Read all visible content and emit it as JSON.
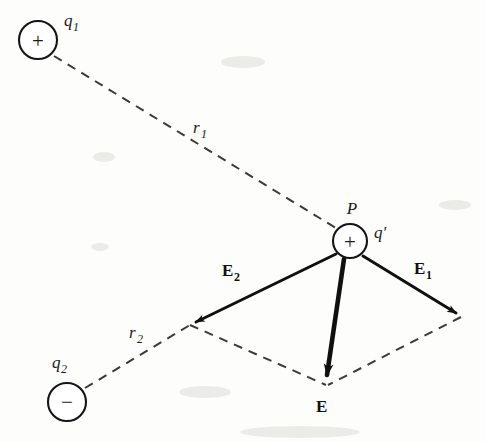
{
  "figure": {
    "background_color": "#fdfdfc",
    "ink_color": "#101010",
    "dash_color": "#3a3a3a",
    "width": 485,
    "height": 442
  },
  "charges": [
    {
      "id": "q1",
      "label": "q",
      "subscript": "1",
      "sign": "+",
      "sign_name": "plus",
      "cx": 38,
      "cy": 40,
      "r": 19,
      "label_x": 64,
      "label_y": 26
    },
    {
      "id": "q2",
      "label": "q",
      "subscript": "2",
      "sign": "−",
      "sign_name": "minus",
      "cx": 67,
      "cy": 402,
      "r": 19,
      "label_x": 52,
      "label_y": 368
    },
    {
      "id": "qprime",
      "label": "q′",
      "subscript": "",
      "sign": "+",
      "sign_name": "plus",
      "cx": 350,
      "cy": 241,
      "r": 17,
      "label_x": 374,
      "label_y": 238
    }
  ],
  "point_label": {
    "text": "P",
    "x": 352,
    "y": 214
  },
  "distances": [
    {
      "id": "r1",
      "label": "r",
      "subscript": "1",
      "from": "q1",
      "to": "P",
      "x1": 54,
      "y1": 56,
      "x2": 336,
      "y2": 228,
      "label_x": 193,
      "label_y": 133
    },
    {
      "id": "r2",
      "label": "r",
      "subscript": "2",
      "from": "q2",
      "to": "E2-tip",
      "x1": 85,
      "y1": 388,
      "x2": 190,
      "y2": 325,
      "label_x": 129,
      "label_y": 338
    }
  ],
  "vectors": [
    {
      "id": "E1",
      "label": "E",
      "subscript": "1",
      "x1": 363,
      "y1": 256,
      "x2": 461,
      "y2": 316,
      "width": 3.0,
      "label_x": 414,
      "label_y": 274
    },
    {
      "id": "E2",
      "label": "E",
      "subscript": "2",
      "x1": 336,
      "y1": 254,
      "x2": 190,
      "y2": 325,
      "width": 3.0,
      "label_x": 222,
      "label_y": 276
    },
    {
      "id": "E",
      "label": "E",
      "subscript": "",
      "x1": 344,
      "y1": 259,
      "x2": 326,
      "y2": 384,
      "width": 4.6,
      "label_x": 316,
      "label_y": 412
    }
  ],
  "parallelogram": [
    {
      "id": "edge-left",
      "x1": 190,
      "y1": 325,
      "x2": 326,
      "y2": 385
    },
    {
      "id": "edge-right",
      "x1": 461,
      "y1": 317,
      "x2": 328,
      "y2": 385
    }
  ]
}
